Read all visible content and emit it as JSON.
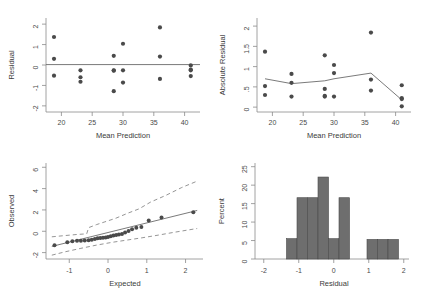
{
  "figure": {
    "background_color": "#ffffff",
    "marker_color": "#4a4a4a",
    "line_color": "#6b6b6b",
    "bar_fill_color": "#6e6e6e",
    "bar_edge_color": "#4a4a4a",
    "axis_color": "#8a8a8a"
  },
  "chart_data": [
    {
      "type": "scatter",
      "name": "residual-vs-mean-prediction",
      "title": "",
      "xlabel": "Mean Prediction",
      "ylabel": "Residual",
      "xlim": [
        17.5,
        42.5
      ],
      "ylim": [
        -2.3,
        2.3
      ],
      "xticks": [
        20,
        25,
        30,
        35,
        40
      ],
      "xtick_labels": [
        "20",
        "25",
        "30",
        "35",
        "40"
      ],
      "yticks": [
        -2,
        -1,
        0,
        1,
        2
      ],
      "ytick_labels": [
        "-2",
        "-1",
        "0",
        "1",
        "2"
      ],
      "grid": false,
      "legend": "none",
      "reference_line": {
        "type": "horizontal",
        "y": 0.02,
        "x_from": 17.5,
        "x_to": 42.5
      },
      "x": [
        18.8,
        18.8,
        18.8,
        23.1,
        23.1,
        23.1,
        28.5,
        28.5,
        28.5,
        28.5,
        30.0,
        30.0,
        30.0,
        36.0,
        36.0,
        36.0,
        41.0,
        41.0,
        41.0,
        41.0
      ],
      "y": [
        1.37,
        0.3,
        -0.52,
        -0.26,
        -0.6,
        -0.82,
        0.45,
        -0.28,
        -0.26,
        -1.28,
        1.04,
        -0.26,
        -0.86,
        1.84,
        0.41,
        -0.68,
        -0.02,
        -0.22,
        -0.26,
        -0.54
      ]
    },
    {
      "type": "scatter",
      "name": "absolute-residual-vs-mean-prediction",
      "title": "",
      "xlabel": "Mean Prediction",
      "ylabel": "Absolute Residual",
      "xlim": [
        17.5,
        42.5
      ],
      "ylim": [
        -0.12,
        2.2
      ],
      "xticks": [
        20,
        25,
        30,
        35,
        40
      ],
      "xtick_labels": [
        "20",
        "25",
        "30",
        "35",
        "40"
      ],
      "yticks": [
        0,
        0.5,
        1,
        1.5,
        2
      ],
      "ytick_labels": [
        "0",
        ".5",
        "1",
        "1.5",
        "2"
      ],
      "grid": false,
      "legend": "none",
      "x": [
        18.8,
        18.8,
        18.8,
        23.1,
        23.1,
        23.1,
        28.5,
        28.5,
        28.5,
        28.5,
        30.0,
        30.0,
        30.0,
        36.0,
        36.0,
        36.0,
        41.0,
        41.0,
        41.0,
        41.0
      ],
      "y": [
        1.37,
        0.52,
        0.3,
        0.82,
        0.6,
        0.26,
        1.28,
        0.45,
        0.28,
        0.26,
        1.04,
        0.84,
        0.26,
        1.84,
        0.68,
        0.41,
        0.54,
        0.22,
        0.2,
        0.02
      ],
      "trend_line": {
        "name": "lowess",
        "x": [
          18.8,
          23.1,
          28.5,
          30.0,
          36.0,
          41.0
        ],
        "y": [
          0.7,
          0.58,
          0.65,
          0.7,
          0.84,
          0.18
        ]
      }
    },
    {
      "type": "scatter",
      "name": "normal-quantile-plot",
      "title": "",
      "xlabel": "Expected",
      "ylabel": "Observed",
      "xlim": [
        -1.6,
        2.45
      ],
      "ylim": [
        -2.6,
        6.4
      ],
      "xticks": [
        -1,
        0,
        1,
        2
      ],
      "xtick_labels": [
        "-1",
        "0",
        "1",
        "2"
      ],
      "yticks": [
        -2,
        0,
        2,
        4,
        6
      ],
      "ytick_labels": [
        "-2",
        "0",
        "2",
        "4",
        "6"
      ],
      "grid": false,
      "legend": "none",
      "x": [
        -1.38,
        -1.05,
        -0.92,
        -0.8,
        -0.7,
        -0.6,
        -0.5,
        -0.42,
        -0.34,
        -0.27,
        -0.2,
        -0.13,
        -0.06,
        0.0,
        0.07,
        0.14,
        0.21,
        0.28,
        0.36,
        0.44,
        0.53,
        0.62,
        0.73,
        0.86,
        1.05,
        1.38,
        2.2
      ],
      "y": [
        -1.32,
        -1.02,
        -0.94,
        -0.9,
        -0.88,
        -0.86,
        -0.84,
        -0.8,
        -0.72,
        -0.66,
        -0.62,
        -0.6,
        -0.58,
        -0.54,
        -0.46,
        -0.4,
        -0.36,
        -0.3,
        -0.26,
        -0.12,
        0.02,
        0.18,
        0.32,
        0.4,
        1.02,
        1.3,
        1.78
      ],
      "fit_line": {
        "x_from": -1.45,
        "y_from": -1.42,
        "x_to": 2.3,
        "y_to": 1.95
      },
      "upper_band": {
        "x": [
          -1.45,
          -1.1,
          -0.8,
          -0.55,
          -0.5,
          -0.3,
          -0.1,
          0.2,
          0.5,
          0.8,
          1.1,
          1.5,
          1.9,
          2.3
        ],
        "y": [
          -0.52,
          -0.4,
          -0.3,
          -0.24,
          0.34,
          0.62,
          0.86,
          1.22,
          1.68,
          2.1,
          2.74,
          3.38,
          4.1,
          4.7
        ]
      },
      "lower_band": {
        "x": [
          -1.45,
          -1.1,
          -0.7,
          -0.3,
          0.1,
          0.5,
          0.9,
          1.3,
          1.7,
          2.1,
          2.3
        ],
        "y": [
          -2.24,
          -1.92,
          -1.6,
          -1.3,
          -1.04,
          -0.82,
          -0.6,
          -0.36,
          -0.1,
          0.14,
          0.26
        ]
      }
    },
    {
      "type": "bar",
      "name": "residual-histogram",
      "title": "",
      "xlabel": "Residual",
      "ylabel": "Percent",
      "xlim": [
        -2.25,
        2.15
      ],
      "ylim": [
        0,
        26
      ],
      "xticks": [
        -2,
        -1,
        0,
        1,
        2
      ],
      "xtick_labels": [
        "-2",
        "-1",
        "0",
        "1",
        "2"
      ],
      "yticks": [
        0,
        5,
        10,
        15,
        20,
        25
      ],
      "ytick_labels": [
        "0",
        "5",
        "10",
        "15",
        "20",
        "25"
      ],
      "grid": false,
      "legend": "none",
      "bin_width": 0.3,
      "bin_starts": [
        -1.35,
        -1.05,
        -0.75,
        -0.45,
        -0.15,
        0.15,
        0.45,
        0.95,
        1.25,
        1.55
      ],
      "categories": [
        "-1.35 to -1.05",
        "-1.05 to -0.75",
        "-0.75 to -0.45",
        "-0.45 to -0.15",
        "-0.15 to 0.15",
        "0.15 to 0.45",
        "0.45 to 0.75",
        "0.95 to 1.25",
        "1.25 to 1.55",
        "1.55 to 1.85"
      ],
      "values": [
        5.5,
        16.6,
        16.6,
        22.2,
        5.5,
        16.6,
        0,
        5.3,
        5.3,
        5.3
      ]
    }
  ]
}
